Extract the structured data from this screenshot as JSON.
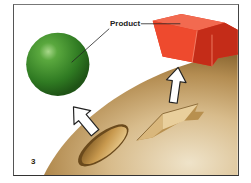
{
  "figure": {
    "panel_number": "3",
    "labels": {
      "product": "Product"
    },
    "objects": [
      {
        "name": "green-sphere",
        "color": "#3d8c2c"
      },
      {
        "name": "red-block",
        "color": "#e8402a"
      },
      {
        "name": "enzyme-surface",
        "color": "#c9a46a"
      },
      {
        "name": "oval-pocket"
      },
      {
        "name": "angular-pocket"
      },
      {
        "name": "arrow-left",
        "direction": "up"
      },
      {
        "name": "arrow-right",
        "direction": "up"
      }
    ],
    "colors": {
      "surface_light": "#e8d7b8",
      "surface_mid": "#c9a46a",
      "surface_dark": "#a07a3e",
      "sphere": "#3d8c2c",
      "block": "#e8402a",
      "frame": "#444444"
    }
  }
}
